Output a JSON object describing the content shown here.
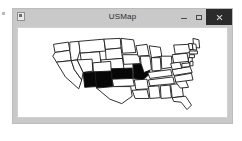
{
  "window": {
    "title": "USMap",
    "menu_icon": "window-menu-icon",
    "controls": {
      "minimize_label": "–",
      "minimize_icon": "minimize-icon",
      "maximize_label": "□",
      "maximize_icon": "maximize-icon",
      "close_label": "×",
      "close_icon": "close-icon"
    }
  },
  "map": {
    "name": "united-states-map",
    "region": "Continental United States",
    "default_fill": "#ffffff",
    "selected_fill": "#070707",
    "outline_color": "#1a1a1a",
    "selected_states": [
      "Arizona",
      "New Mexico",
      "Kansas",
      "Missouri"
    ],
    "selected_count": 4,
    "states": [
      {
        "name": "Washington",
        "abbr": "WA",
        "selected": false,
        "d": "M28,22 L48,19 L50,30 L30,33 Z"
      },
      {
        "name": "Oregon",
        "abbr": "OR",
        "selected": false,
        "d": "M30,33 L50,30 L52,44 L32,46 L27,38 Z"
      },
      {
        "name": "Idaho",
        "abbr": "ID",
        "selected": false,
        "d": "M50,19 L62,18 L64,30 L60,43 L52,44 L50,30 Z"
      },
      {
        "name": "Montana",
        "abbr": "MT",
        "selected": false,
        "d": "M62,18 L96,15 L98,31 L64,34 Z"
      },
      {
        "name": "Wyoming",
        "abbr": "WY",
        "selected": false,
        "d": "M64,34 L90,32 L92,47 L66,49 Z"
      },
      {
        "name": "North Dakota",
        "abbr": "ND",
        "selected": false,
        "d": "M96,15 L118,14 L119,27 L98,29 Z"
      },
      {
        "name": "South Dakota",
        "abbr": "SD",
        "selected": false,
        "d": "M98,29 L119,27 L121,41 L99,43 Z"
      },
      {
        "name": "Nebraska",
        "abbr": "NE",
        "selected": false,
        "d": "M92,43 L121,41 L123,55 L93,56 Z"
      },
      {
        "name": "California",
        "abbr": "CA",
        "selected": false,
        "d": "M32,46 L52,44 L56,56 L66,70 L62,82 L44,66 Z"
      },
      {
        "name": "Nevada",
        "abbr": "NV",
        "selected": false,
        "d": "M52,44 L60,43 L68,60 L66,70 L56,56 Z"
      },
      {
        "name": "Utah",
        "abbr": "UT",
        "selected": false,
        "d": "M60,43 L80,42 L81,58 L68,60 Z"
      },
      {
        "name": "Colorado",
        "abbr": "CO",
        "selected": false,
        "d": "M81,47 L105,45 L106,61 L82,62 Z"
      },
      {
        "name": "Arizona",
        "abbr": "AZ",
        "selected": true,
        "d": "M68,60 L84,59 L86,79 L70,80 Z"
      },
      {
        "name": "New Mexico",
        "abbr": "NM",
        "selected": true,
        "d": "M84,59 L106,58 L108,80 L86,81 Z"
      },
      {
        "name": "Kansas",
        "abbr": "KS",
        "selected": true,
        "d": "M106,55 L134,54 L135,68 L107,69 Z"
      },
      {
        "name": "Oklahoma",
        "abbr": "OK",
        "selected": false,
        "d": "M107,69 L135,68 L137,78 L109,79 Z"
      },
      {
        "name": "Texas",
        "abbr": "TX",
        "selected": false,
        "d": "M86,81 L109,79 L132,79 L134,92 L120,102 L104,96 L92,86 Z"
      },
      {
        "name": "Minnesota",
        "abbr": "MN",
        "selected": false,
        "d": "M119,14 L136,16 L139,33 L121,34 Z"
      },
      {
        "name": "Iowa",
        "abbr": "IA",
        "selected": false,
        "d": "M121,36 L143,36 L145,48 L123,49 Z"
      },
      {
        "name": "Missouri",
        "abbr": "MO",
        "selected": true,
        "d": "M135,49 L156,48 L158,62 L148,70 L136,68 Z"
      },
      {
        "name": "Arkansas",
        "abbr": "AR",
        "selected": false,
        "d": "M137,70 L154,69 L156,82 L139,83 Z"
      },
      {
        "name": "Louisiana",
        "abbr": "LA",
        "selected": false,
        "d": "M134,84 L154,83 L157,95 L138,95 Z"
      },
      {
        "name": "Wisconsin",
        "abbr": "WI",
        "selected": false,
        "d": "M139,24 L154,22 L157,37 L142,38 Z"
      },
      {
        "name": "Illinois",
        "abbr": "IL",
        "selected": false,
        "d": "M145,38 L158,38 L160,56 L150,60 L146,48 Z"
      },
      {
        "name": "Michigan",
        "abbr": "MI",
        "selected": false,
        "d": "M157,24 L172,26 L174,38 L160,40 Z"
      },
      {
        "name": "Indiana",
        "abbr": "IN",
        "selected": false,
        "d": "M160,40 L172,40 L173,57 L161,58 Z"
      },
      {
        "name": "Ohio",
        "abbr": "OH",
        "selected": false,
        "d": "M173,38 L187,38 L188,53 L174,55 Z"
      },
      {
        "name": "Kentucky",
        "abbr": "KY",
        "selected": false,
        "d": "M155,60 L186,56 L188,64 L158,68 Z"
      },
      {
        "name": "Tennessee",
        "abbr": "TN",
        "selected": false,
        "d": "M156,70 L189,66 L191,75 L158,78 Z"
      },
      {
        "name": "Mississippi",
        "abbr": "MS",
        "selected": false,
        "d": "M156,79 L170,78 L172,94 L158,95 Z"
      },
      {
        "name": "Alabama",
        "abbr": "AL",
        "selected": false,
        "d": "M172,78 L185,77 L187,94 L173,95 Z"
      },
      {
        "name": "Georgia",
        "abbr": "GA",
        "selected": false,
        "d": "M186,76 L201,75 L203,92 L188,94 Z"
      },
      {
        "name": "Florida",
        "abbr": "FL",
        "selected": false,
        "d": "M188,94 L206,92 L214,104 L208,110 L200,100 L190,99 Z"
      },
      {
        "name": "South Carolina",
        "abbr": "SC",
        "selected": false,
        "d": "M192,72 L206,70 L210,80 L199,81 Z"
      },
      {
        "name": "North Carolina",
        "abbr": "NC",
        "selected": false,
        "d": "M191,65 L214,61 L216,70 L193,73 Z"
      },
      {
        "name": "Virginia",
        "abbr": "VA",
        "selected": false,
        "d": "M188,56 L212,52 L215,60 L190,64 Z"
      },
      {
        "name": "West Virginia",
        "abbr": "WV",
        "selected": false,
        "d": "M186,48 L198,45 L201,54 L188,56 Z"
      },
      {
        "name": "Pennsylvania",
        "abbr": "PA",
        "selected": false,
        "d": "M188,36 L208,34 L210,45 L190,47 Z"
      },
      {
        "name": "New York",
        "abbr": "NY",
        "selected": false,
        "d": "M190,23 L210,22 L213,33 L192,35 Z"
      },
      {
        "name": "Maine",
        "abbr": "ME",
        "selected": false,
        "d": "M216,14 L224,16 L225,27 L217,26 Z"
      },
      {
        "name": "Vermont",
        "abbr": "VT",
        "selected": false,
        "d": "M210,21 L215,21 L216,29 L211,29 Z"
      },
      {
        "name": "New Hampshire",
        "abbr": "NH",
        "selected": false,
        "d": "M215,21 L220,22 L221,30 L216,29 Z"
      },
      {
        "name": "Massachusetts",
        "abbr": "MA",
        "selected": false,
        "d": "M211,31 L222,31 L222,35 L211,35 Z"
      },
      {
        "name": "Connecticut",
        "abbr": "CT",
        "selected": false,
        "d": "M211,36 L218,36 L218,40 L211,40 Z"
      },
      {
        "name": "New Jersey",
        "abbr": "NJ",
        "selected": false,
        "d": "M210,40 L215,40 L215,47 L210,47 Z"
      },
      {
        "name": "Maryland",
        "abbr": "MD",
        "selected": false,
        "d": "M201,48 L212,47 L212,52 L201,53 Z"
      },
      {
        "name": "Delaware",
        "abbr": "DE",
        "selected": false,
        "d": "M212,45 L216,45 L216,51 L212,51 Z"
      }
    ]
  }
}
